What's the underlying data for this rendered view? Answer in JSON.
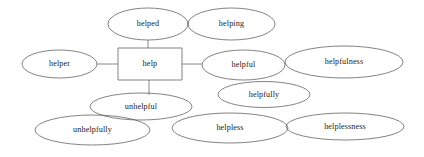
{
  "diagram": {
    "type": "word-family-network",
    "background_color": "#ffffff",
    "stroke_color": "#5a5a5a",
    "connector_color": "#7a7a7a",
    "text_color": "#1d1d1d",
    "root": {
      "label": "help",
      "shape": "rectangle",
      "x": 118,
      "y": 48,
      "width": 64,
      "height": 32
    },
    "nodes": [
      {
        "id": "helped",
        "label": "helped",
        "shape": "ellipse",
        "cx": 148,
        "cy": 24,
        "rx": 40,
        "ry": 16
      },
      {
        "id": "helping",
        "label": "helping",
        "shape": "ellipse",
        "cx": 231.5,
        "cy": 24,
        "rx": 43.5,
        "ry": 16
      },
      {
        "id": "helper",
        "label": "helper",
        "shape": "ellipse",
        "cx": 59.5,
        "cy": 64,
        "rx": 37.5,
        "ry": 14
      },
      {
        "id": "helpful",
        "label": "helpful",
        "shape": "ellipse",
        "cx": 243.5,
        "cy": 65,
        "rx": 41.5,
        "ry": 15
      },
      {
        "id": "helpfulness",
        "label": "helpfulness",
        "shape": "ellipse",
        "cx": 344,
        "cy": 62,
        "rx": 59,
        "ry": 16
      },
      {
        "id": "helpfully",
        "label": "helpfully",
        "shape": "ellipse",
        "cx": 264,
        "cy": 94.5,
        "rx": 46,
        "ry": 13
      },
      {
        "id": "unhelpful",
        "label": "unhelpful",
        "shape": "ellipse",
        "cx": 141,
        "cy": 106.5,
        "rx": 51,
        "ry": 13.5
      },
      {
        "id": "unhelpfully",
        "label": "unhelpfully",
        "shape": "ellipse",
        "cx": 92.5,
        "cy": 130,
        "rx": 57.5,
        "ry": 15
      },
      {
        "id": "helpless",
        "label": "helpless",
        "shape": "ellipse",
        "cx": 230,
        "cy": 128,
        "rx": 58,
        "ry": 15
      },
      {
        "id": "helplessness",
        "label": "helplessness",
        "shape": "ellipse",
        "cx": 345,
        "cy": 126.5,
        "rx": 59,
        "ry": 13.5
      }
    ],
    "connectors": [
      {
        "id": "root-helped",
        "from": "help",
        "to": "helped",
        "x1": 148,
        "y1": 40,
        "x2": 148,
        "y2": 48
      },
      {
        "id": "root-helper",
        "from": "help",
        "to": "helper",
        "x1": 97,
        "y1": 64,
        "x2": 118,
        "y2": 64
      },
      {
        "id": "root-helpful",
        "from": "help",
        "to": "helpful",
        "x1": 182,
        "y1": 64,
        "x2": 202,
        "y2": 64
      },
      {
        "id": "root-unhelpful",
        "from": "help",
        "to": "unhelpful",
        "x1": 149,
        "y1": 80,
        "x2": 149,
        "y2": 95
      }
    ]
  }
}
